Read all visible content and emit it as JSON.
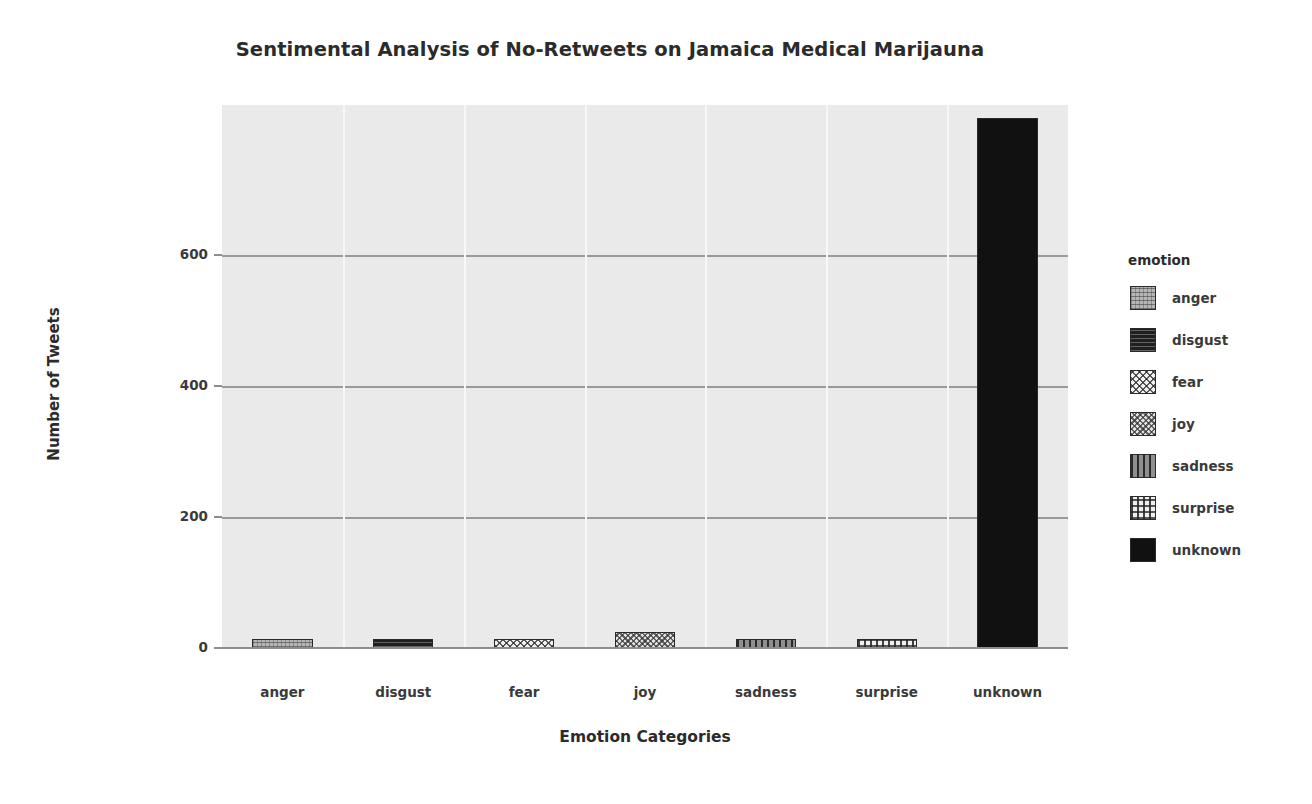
{
  "chart_data": {
    "type": "bar",
    "title": "Sentimental Analysis of No-Retweets on Jamaica Medical Marijauna",
    "xlabel": "Emotion Categories",
    "ylabel": "Number of Tweets",
    "categories": [
      "anger",
      "disgust",
      "fear",
      "joy",
      "sadness",
      "surprise",
      "unknown"
    ],
    "values": [
      14,
      13,
      8,
      25,
      11,
      13,
      810
    ],
    "ylim": [
      0,
      830
    ],
    "yticks": [
      0,
      200,
      400,
      600
    ],
    "ytick_labels": [
      "0",
      "200",
      "400",
      "600"
    ],
    "grid": "horizontal-major-only",
    "legend": {
      "title": "emotion",
      "position": "right",
      "entries": [
        {
          "label": "anger",
          "pattern": "dotted-light-gray",
          "color": "#b5b5b5"
        },
        {
          "label": "disgust",
          "pattern": "horizontal-lines-dark",
          "color": "#1f1f1f"
        },
        {
          "label": "fear",
          "pattern": "crosshatch-diagonal-light",
          "color": "#f0f0f0"
        },
        {
          "label": "joy",
          "pattern": "crosshatch-fine",
          "color": "#e2e2e2"
        },
        {
          "label": "sadness",
          "pattern": "vertical-lines-gray",
          "color": "#8f8f8f"
        },
        {
          "label": "surprise",
          "pattern": "grid-lines-light",
          "color": "#efefef"
        },
        {
          "label": "unknown",
          "pattern": "solid-black",
          "color": "#111111"
        }
      ]
    },
    "style": {
      "plot_background": "#eaeaea",
      "gridline_color": "#9a9a9a",
      "axis_color": "#8d8d8d",
      "text_color": "#2b2b2b"
    }
  }
}
